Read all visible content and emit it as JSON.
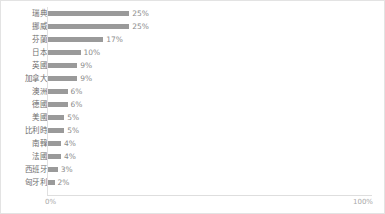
{
  "chart_data": {
    "type": "bar",
    "orientation": "horizontal",
    "title": "",
    "subtitle": "",
    "xlabel": "",
    "ylabel": "",
    "xlim": [
      0,
      100
    ],
    "grid": false,
    "legend": null,
    "bar_color": "#9a9a9a",
    "label_color": "#6e6e6e",
    "value_color": "#8a8a8a",
    "axis_color": "#dedede",
    "border_color": "#e3e3e3",
    "axis_ticks": [
      "0%",
      "100%"
    ],
    "categories": [
      "瑞典",
      "挪威",
      "芬蘭",
      "日本",
      "英國",
      "加拿大",
      "澳洲",
      "德國",
      "美國",
      "比利時",
      "南韓",
      "法國",
      "西班牙",
      "匈牙利"
    ],
    "values": [
      25,
      25,
      17,
      10,
      9,
      9,
      6,
      6,
      5,
      5,
      4,
      4,
      3,
      2
    ],
    "value_labels": [
      "25%",
      "25%",
      "17%",
      "10%",
      "9%",
      "9%",
      "6%",
      "6%",
      "5%",
      "5%",
      "4%",
      "4%",
      "3%",
      "2%"
    ]
  }
}
